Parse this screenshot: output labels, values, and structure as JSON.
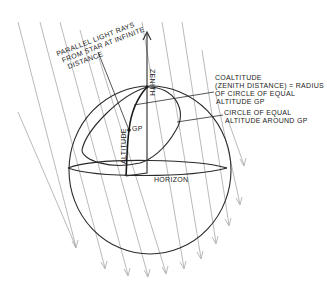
{
  "diagram": {
    "labels": {
      "rays_line1": "PARALLEL LIGHT RAYS",
      "rays_line2": "FROM STAR AT INFINITE",
      "rays_line3": "DISTANCE",
      "zenith": "ZENITH",
      "gp": "GP",
      "altitude": "ALTITUDE",
      "horizon": "HORIZON",
      "coaltitude_line1": "COALTITUDE",
      "coaltitude_line2": "(ZENITH DISTANCE) = RADIUS",
      "coaltitude_line3": "OF CIRCLE OF EQUAL",
      "coaltitude_line4": "ALTITUDE GP",
      "circle_line1": "CIRCLE OF EQUAL",
      "circle_line2": "ALTITUDE AROUND GP"
    },
    "colors": {
      "ink": "#2a2a2a",
      "rays": "#a8a8a8",
      "background": "#ffffff"
    },
    "ray_count": 12
  }
}
